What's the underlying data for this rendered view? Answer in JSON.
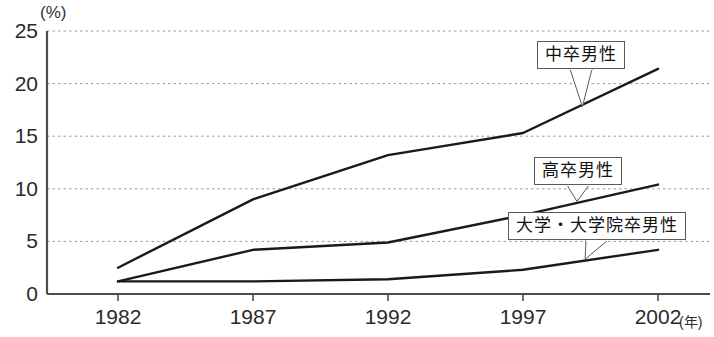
{
  "chart_data": {
    "type": "line",
    "title": "",
    "xlabel": "年",
    "ylabel": "(%)",
    "x": [
      1982,
      1987,
      1992,
      1997,
      2002
    ],
    "xtick_labels": [
      "1982",
      "1987",
      "1992",
      "1997",
      "2002"
    ],
    "ytick_labels": [
      "0",
      "5",
      "10",
      "15",
      "20",
      "25"
    ],
    "ytick_values": [
      0,
      5,
      10,
      15,
      20,
      25
    ],
    "ylim": [
      0,
      25
    ],
    "grid": "horizontal-dotted",
    "legend_position": "inline-callouts",
    "series": [
      {
        "name": "中卒男性",
        "values": [
          2.5,
          9.0,
          13.2,
          15.3,
          21.4
        ],
        "color": "#1a1a1a"
      },
      {
        "name": "高卒男性",
        "values": [
          1.2,
          4.2,
          4.9,
          7.5,
          10.4
        ],
        "color": "#1a1a1a"
      },
      {
        "name": "大学・大学院卒男性",
        "values": [
          1.2,
          1.2,
          1.4,
          2.3,
          4.2
        ],
        "color": "#1a1a1a"
      }
    ],
    "annotations": [
      {
        "label": "中卒男性",
        "target_x": 1999.2,
        "target_y": 17.8,
        "box_left": 537,
        "box_top": 41
      },
      {
        "label": "高卒男性",
        "target_x": 1999.0,
        "target_y": 8.8,
        "box_left": 534,
        "box_top": 157
      },
      {
        "label": "大学・大学院卒男性",
        "target_x": 1999.3,
        "target_y": 3.3,
        "box_left": 508,
        "box_top": 212
      }
    ]
  },
  "axis": {
    "y_unit": "(%)",
    "x_unit": "(年)"
  }
}
